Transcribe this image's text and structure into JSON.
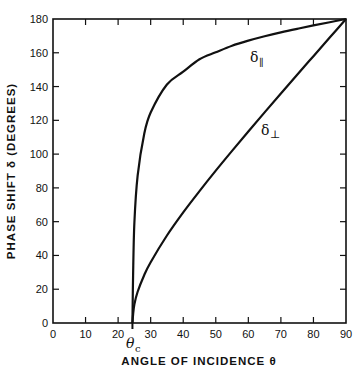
{
  "chart_data": {
    "type": "line",
    "title": "",
    "xlabel": "ANGLE OF INCIDENCE θ",
    "ylabel": "PHASE SHIFT δ (DEGREES)",
    "xlim": [
      0,
      90
    ],
    "ylim": [
      0,
      180
    ],
    "x_ticks": [
      0,
      10,
      20,
      30,
      40,
      50,
      60,
      70,
      80,
      90
    ],
    "y_ticks": [
      0,
      20,
      40,
      60,
      80,
      100,
      120,
      140,
      160,
      180
    ],
    "grid": false,
    "legend": "none (inline curve labels)",
    "annotations": [
      {
        "text": "θc",
        "x": 24.4,
        "position": "below x-axis",
        "meaning": "critical angle"
      },
      {
        "text": "δ∥",
        "x": 63,
        "y": 163,
        "series": "parallel"
      },
      {
        "text": "δ⊥",
        "x": 72,
        "y": 120,
        "series": "perpendicular"
      }
    ],
    "critical_angle": 24.4,
    "series": [
      {
        "name": "δ∥",
        "x": [
          24.4,
          24.6,
          25,
          26,
          28,
          30,
          35,
          40,
          45,
          50,
          55,
          60,
          65,
          70,
          75,
          80,
          85,
          90
        ],
        "values": [
          0,
          28,
          59.5,
          87.3,
          111.8,
          124.6,
          141.2,
          148.8,
          156.2,
          160.3,
          164.2,
          167.2,
          169.8,
          172.1,
          174.2,
          176.2,
          178.1,
          180
        ]
      },
      {
        "name": "δ⊥",
        "x": [
          24.4,
          24.6,
          25,
          26,
          28,
          30,
          35,
          40,
          45,
          50,
          55,
          60,
          65,
          70,
          75,
          80,
          85,
          90
        ],
        "values": [
          0,
          5,
          11.1,
          18.5,
          28.3,
          36.0,
          51.8,
          65.5,
          78.1,
          90.2,
          101.9,
          113.4,
          124.7,
          135.9,
          147.0,
          158.0,
          169.0,
          180
        ]
      }
    ]
  },
  "labels": {
    "ylabel_text": "PHASE SHIFT δ (DEGREES)",
    "xlabel_text": "ANGLE OF INCIDENCE θ",
    "theta_c_main": "θ",
    "theta_c_sub": "c",
    "delta_par_main": "δ",
    "delta_par_sub": "∥",
    "delta_perp_main": "δ",
    "delta_perp_sub": "⊥"
  },
  "style": {
    "line_color": "#111111",
    "background": "#ffffff"
  }
}
